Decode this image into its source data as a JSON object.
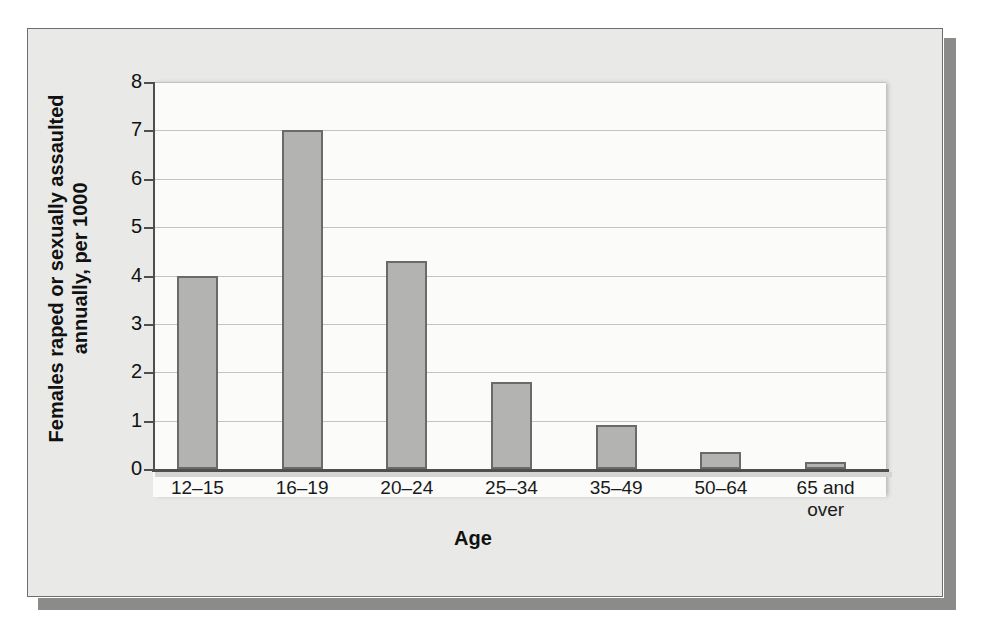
{
  "figure": {
    "background_color": "#e9eae8",
    "plot_background_color": "#fbfbfa",
    "border_color": "#6e6f6d",
    "shadow_color": "#8b8c8a"
  },
  "chart_data": {
    "type": "bar",
    "title": "",
    "xlabel": "Age",
    "ylabel_line1": "Females raped or sexually assaulted",
    "ylabel_line2": "annually, per 1000",
    "categories": [
      "12–15",
      "16–19",
      "20–24",
      "25–34",
      "35–49",
      "50–64",
      "65 and over"
    ],
    "category_lines": [
      [
        "12–15"
      ],
      [
        "16–19"
      ],
      [
        "20–24"
      ],
      [
        "25–34"
      ],
      [
        "35–49"
      ],
      [
        "50–64"
      ],
      [
        "65 and",
        "over"
      ]
    ],
    "values": [
      4.0,
      7.0,
      4.3,
      1.8,
      0.9,
      0.35,
      0.15
    ],
    "ylim": [
      0,
      8
    ],
    "yticks": [
      0,
      1,
      2,
      3,
      4,
      5,
      6,
      7,
      8
    ],
    "ytick_labels": [
      "0",
      "1",
      "2",
      "3",
      "4",
      "5",
      "6",
      "7",
      "8"
    ],
    "grid": true,
    "grid_axis": "y",
    "legend": false,
    "bar_fill_color": "#b3b4b2",
    "bar_edge_color": "#6a6b69"
  }
}
